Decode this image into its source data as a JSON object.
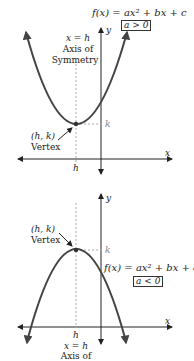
{
  "top_graph": {
    "equation": "f(x) = ax² + bx + c",
    "condition": "a > 0",
    "axis_label_x": "x",
    "axis_label_y": "y",
    "axis_of_symmetry_eq": "x = h",
    "axis_of_symmetry_label_1": "Axis of",
    "axis_of_symmetry_label_2": "Symmetry",
    "vertex_coords": "(h, k)",
    "vertex_label": "Vertex",
    "h_label": "h",
    "k_label": "k"
  },
  "bottom_graph": {
    "equation": "f(x) = ax² + bx + c",
    "condition": "a < 0",
    "axis_label_x": "x",
    "axis_label_y": "y",
    "axis_of_symmetry_eq": "x = h",
    "axis_of_symmetry_label_1": "Axis of",
    "vertex_coords": "(h, k)",
    "vertex_label": "Vertex",
    "h_label": "h",
    "k_label": "k"
  },
  "colors": {
    "curve": "#444444",
    "axis": "#222222",
    "guide": "#aaaaaa"
  }
}
